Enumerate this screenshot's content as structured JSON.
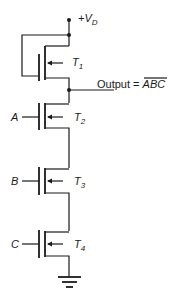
{
  "diagram": {
    "type": "nmos-nand-gate",
    "supply": {
      "label": "+V",
      "subscript": "D"
    },
    "output": {
      "label": "Output = ",
      "expression": "ABC",
      "overbar": true
    },
    "transistors": [
      {
        "name": "T",
        "subscript": "1",
        "role": "load",
        "gate_input": ""
      },
      {
        "name": "T",
        "subscript": "2",
        "role": "driver",
        "gate_input": "A"
      },
      {
        "name": "T",
        "subscript": "3",
        "role": "driver",
        "gate_input": "B"
      },
      {
        "name": "T",
        "subscript": "4",
        "role": "driver",
        "gate_input": "C"
      }
    ],
    "ground": "ground-symbol",
    "colors": {
      "line": "#1a1a1a",
      "background": "#ffffff"
    }
  }
}
